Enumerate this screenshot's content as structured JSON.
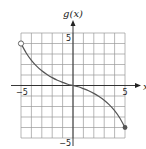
{
  "chart_data": {
    "type": "line",
    "title": "",
    "xlabel": "x",
    "ylabel": "g(x)",
    "xlim": [
      -5,
      5
    ],
    "ylim": [
      -5,
      5
    ],
    "grid": true,
    "x_tick_labels": [
      {
        "value": -5,
        "label": "−5"
      },
      {
        "value": 5,
        "label": "5"
      }
    ],
    "y_tick_labels": [
      {
        "value": 5,
        "label": "5"
      },
      {
        "value": -5,
        "label": "−5"
      }
    ],
    "series": [
      {
        "name": "g(x)",
        "points": [
          [
            -5,
            4
          ],
          [
            -4.5,
            3.1
          ],
          [
            -4,
            2.4
          ],
          [
            -3.5,
            1.85
          ],
          [
            -3,
            1.4
          ],
          [
            -2.5,
            1.05
          ],
          [
            -2,
            0.75
          ],
          [
            -1.5,
            0.5
          ],
          [
            -1,
            0.3
          ],
          [
            -0.5,
            0.12
          ],
          [
            0,
            0
          ],
          [
            0.5,
            -0.12
          ],
          [
            1,
            -0.3
          ],
          [
            1.5,
            -0.5
          ],
          [
            2,
            -0.75
          ],
          [
            2.5,
            -1.05
          ],
          [
            3,
            -1.4
          ],
          [
            3.5,
            -1.85
          ],
          [
            4,
            -2.4
          ],
          [
            4.5,
            -3.1
          ],
          [
            5,
            -4
          ]
        ],
        "start_endpoint": {
          "x": -5,
          "y": 4,
          "style": "open"
        },
        "end_endpoint": {
          "x": 5,
          "y": -4,
          "style": "closed"
        }
      }
    ]
  }
}
